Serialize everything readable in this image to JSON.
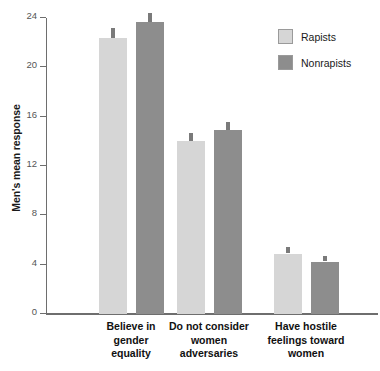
{
  "chart_data": {
    "type": "bar",
    "title": "",
    "xlabel": "",
    "ylabel": "Men's mean response",
    "ylim": [
      0,
      24
    ],
    "yticks": [
      0,
      4,
      8,
      12,
      16,
      20,
      24
    ],
    "grid": false,
    "legend_position": "top-right",
    "categories": [
      "Believe in gender equality",
      "Do not consider women adversaries",
      "Have hostile feelings toward women"
    ],
    "category_lines": [
      [
        "Believe in",
        "gender",
        "equality"
      ],
      [
        "Do not consider",
        "women",
        "adversaries"
      ],
      [
        "Have hostile",
        "feelings toward",
        "women"
      ]
    ],
    "series": [
      {
        "name": "Rapists",
        "color": "#d6d6d6",
        "values": [
          22.4,
          14.0,
          4.9
        ],
        "errors": [
          0.7,
          0.6,
          0.45
        ]
      },
      {
        "name": "Nonrapists",
        "color": "#8d8d8d",
        "values": [
          23.7,
          14.9,
          4.25
        ],
        "errors": [
          0.6,
          0.55,
          0.4
        ]
      }
    ]
  },
  "axis": {
    "tick_labels": [
      "0",
      "4",
      "8",
      "12",
      "16",
      "20",
      "24"
    ],
    "y_title": "Men's mean response"
  },
  "legend": {
    "entries": [
      {
        "label": "Rapists"
      },
      {
        "label": "Nonrapists"
      }
    ]
  }
}
